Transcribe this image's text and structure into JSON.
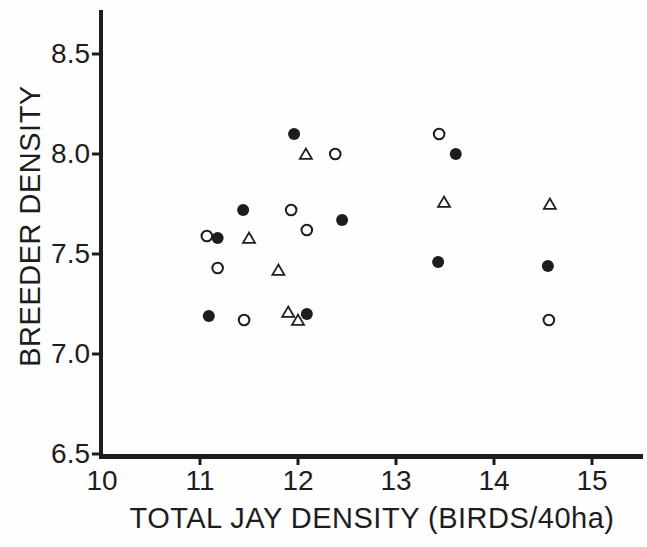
{
  "figure": {
    "ink_color": "#1d1d1d",
    "background": "#fefefe"
  },
  "chart_data": {
    "type": "scatter",
    "title": "",
    "xlabel": "TOTAL JAY DENSITY (BIRDS/40ha)",
    "ylabel": "BREEDER DENSITY",
    "xlim": [
      10,
      15.5
    ],
    "ylim": [
      6.5,
      8.72
    ],
    "grid": false,
    "legend": "none",
    "x_ticks": [
      10,
      11,
      12,
      13,
      14,
      15
    ],
    "x_tick_labels": [
      "10",
      "11",
      "12",
      "13",
      "14",
      "15"
    ],
    "y_ticks": [
      8.5,
      8.0,
      7.5,
      7.0,
      6.5
    ],
    "y_tick_labels": [
      "8.5",
      "8.0",
      "7.5",
      "7.0",
      "6.5"
    ],
    "series": [
      {
        "name": "filled-circle",
        "marker": "filled-circle",
        "points": [
          [
            11.09,
            7.19
          ],
          [
            11.18,
            7.58
          ],
          [
            11.44,
            7.72
          ],
          [
            11.96,
            8.1
          ],
          [
            12.09,
            7.2
          ],
          [
            12.45,
            7.67
          ],
          [
            13.43,
            7.46
          ],
          [
            13.61,
            8.0
          ],
          [
            14.55,
            7.44
          ]
        ]
      },
      {
        "name": "open-circle",
        "marker": "open-circle",
        "points": [
          [
            11.07,
            7.59
          ],
          [
            11.18,
            7.43
          ],
          [
            11.45,
            7.17
          ],
          [
            11.93,
            7.72
          ],
          [
            12.09,
            7.62
          ],
          [
            12.38,
            8.0
          ],
          [
            13.44,
            8.1
          ],
          [
            14.56,
            7.17
          ]
        ]
      },
      {
        "name": "open-triangle",
        "marker": "open-triangle",
        "points": [
          [
            11.5,
            7.58
          ],
          [
            11.8,
            7.42
          ],
          [
            11.9,
            7.21
          ],
          [
            12.0,
            7.17
          ],
          [
            12.08,
            8.0
          ],
          [
            13.49,
            7.76
          ],
          [
            14.57,
            7.75
          ]
        ]
      }
    ]
  }
}
